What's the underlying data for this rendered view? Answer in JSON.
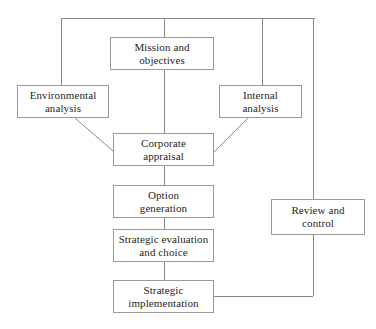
{
  "diagram": {
    "style": {
      "background": "#ffffff",
      "line_color": "#8a8a8a",
      "box_border": "#9a9a9a",
      "text_color": "#1f1f1f"
    },
    "nodes": [
      {
        "id": "mission",
        "label": "Mission and\nobjectives",
        "x": 110,
        "y": 37,
        "width": 104,
        "height": 33
      },
      {
        "id": "environmental",
        "label": "Environmental\nanalysis",
        "x": 17,
        "y": 85,
        "width": 92,
        "height": 33
      },
      {
        "id": "internal",
        "label": "Internal\nanalysis",
        "x": 219,
        "y": 85,
        "width": 83,
        "height": 33
      },
      {
        "id": "corporate",
        "label": "Corporate\nappraisal",
        "x": 113,
        "y": 133,
        "width": 101,
        "height": 33
      },
      {
        "id": "option",
        "label": "Option\ngeneration",
        "x": 113,
        "y": 185,
        "width": 101,
        "height": 33
      },
      {
        "id": "evaluation",
        "label": "Strategic evaluation\nand choice",
        "x": 113,
        "y": 229,
        "width": 101,
        "height": 33
      },
      {
        "id": "implementation",
        "label": "Strategic\nimplementation",
        "x": 113,
        "y": 280,
        "width": 101,
        "height": 33
      },
      {
        "id": "review",
        "label": "Review and\ncontrol",
        "x": 271,
        "y": 199,
        "width": 94,
        "height": 36
      }
    ],
    "connections": [
      {
        "id": "top-bus",
        "kind": "line",
        "points": "61,18 315,18"
      },
      {
        "id": "left-feed-down",
        "kind": "line",
        "points": "61,18 61,85"
      },
      {
        "id": "center-feed-down",
        "kind": "line",
        "points": "164,18 164,37"
      },
      {
        "id": "internal-feed-down",
        "kind": "line",
        "points": "262,18 262,85"
      },
      {
        "id": "right-loop-down",
        "kind": "line",
        "points": "313,18 313,296"
      },
      {
        "id": "mission-to-corporate",
        "kind": "line",
        "points": "164,70 164,133"
      },
      {
        "id": "environmental-to-corporate",
        "kind": "diag",
        "points": "75,118 113,151"
      },
      {
        "id": "internal-to-corporate",
        "kind": "diag",
        "points": "248,118 214,152"
      },
      {
        "id": "corporate-to-option",
        "kind": "line",
        "points": "164,166 164,185"
      },
      {
        "id": "option-to-evaluation",
        "kind": "line",
        "points": "164,218 164,229"
      },
      {
        "id": "evaluation-to-implementation",
        "kind": "line",
        "points": "164,262 164,280"
      },
      {
        "id": "implementation-to-loop",
        "kind": "line",
        "points": "214,296 313,296"
      }
    ]
  }
}
